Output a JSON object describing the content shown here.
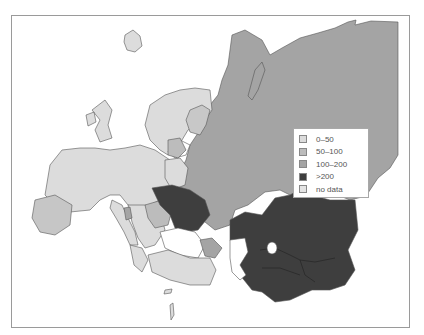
{
  "map": {
    "type": "choropleth",
    "region": "Europe and Central/Northern Asia",
    "colors": {
      "c0_50": "#dcdcdc",
      "c50_100": "#bcbcbc",
      "c100_200": "#a4a4a4",
      "c200plus": "#3e3e3e",
      "no_data": "#e4e4e4",
      "water": "#ffffff",
      "border": "#555555"
    }
  },
  "legend": {
    "items": [
      {
        "label": "0–50",
        "color": "#dcdcdc"
      },
      {
        "label": "50–100",
        "color": "#bcbcbc"
      },
      {
        "label": "100–200",
        "color": "#a4a4a4"
      },
      {
        "label": ">200",
        "color": "#3e3e3e"
      },
      {
        "label": "no data",
        "color": "#e4e4e4"
      }
    ]
  }
}
